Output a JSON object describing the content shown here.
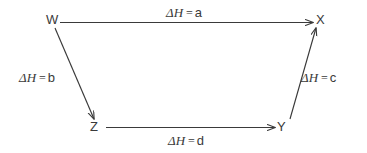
{
  "diagram": {
    "type": "hess-cycle-energy-diagram",
    "background_color": "#ffffff",
    "stroke_color": "#3a3a3a",
    "vertices": [
      {
        "id": "W",
        "label": "W",
        "x": 52,
        "y": 20
      },
      {
        "id": "X",
        "label": "X",
        "x": 321,
        "y": 20
      },
      {
        "id": "Z",
        "label": "Z",
        "x": 95,
        "y": 127
      },
      {
        "id": "Y",
        "label": "Y",
        "x": 282,
        "y": 127
      }
    ],
    "edges": [
      {
        "id": "edge-a",
        "from": "W",
        "to": "X",
        "symbol": "ΔH",
        "equals": "=",
        "value": "a",
        "label": "ΔH = a",
        "direction": "right",
        "label_position": "above"
      },
      {
        "id": "edge-b",
        "from": "W",
        "to": "Z",
        "symbol": "ΔH",
        "equals": "=",
        "value": "b",
        "label": "ΔH = b",
        "direction": "down-right",
        "label_position": "left"
      },
      {
        "id": "edge-c",
        "from": "Y",
        "to": "X",
        "symbol": "ΔH",
        "equals": "=",
        "value": "c",
        "label": "ΔH = c",
        "direction": "up-right",
        "label_position": "right"
      },
      {
        "id": "edge-d",
        "from": "Z",
        "to": "Y",
        "symbol": "ΔH",
        "equals": "=",
        "value": "d",
        "label": "ΔH = d",
        "direction": "right",
        "label_position": "below"
      }
    ]
  }
}
